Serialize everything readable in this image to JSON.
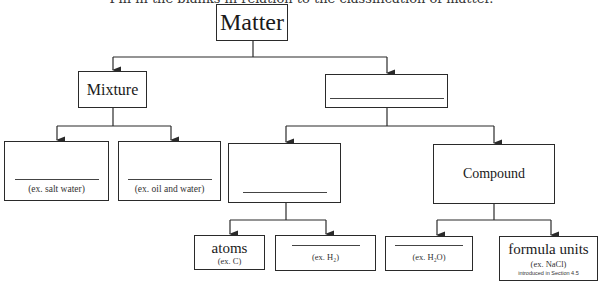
{
  "caption": "Fill in the blanks in relation to the classification of matter.",
  "diagram": {
    "root": {
      "label": "Matter"
    },
    "mixture": {
      "label": "Mixture"
    },
    "pure_substance": {
      "label": ""
    },
    "homogeneous_mixture": {
      "label": "",
      "example": "(ex. salt water)"
    },
    "heterogeneous_mixture": {
      "label": "",
      "example": "(ex. oil and water)"
    },
    "element": {
      "label": ""
    },
    "compound": {
      "label": "Compound"
    },
    "atoms": {
      "label": "atoms",
      "example": "(ex. C)"
    },
    "molecules_element": {
      "label": "",
      "example": "(ex. H₂)"
    },
    "molecules_compound": {
      "label": "",
      "example": "(ex. H₂O)"
    },
    "formula_units": {
      "label": "formula units",
      "example": "(ex. NaCl)",
      "note": "introduced in Section 4.5"
    }
  },
  "colors": {
    "line": "#2a2a2a",
    "background": "#ffffff"
  }
}
